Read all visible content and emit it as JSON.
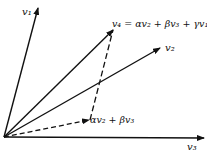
{
  "diagram": {
    "labels": {
      "v1": "v₁",
      "v2": "v₂",
      "v3": "v₃",
      "v4": "v₄ = αv₂ + βv₃ + γv₁",
      "projection": "αv₂ + βv₃"
    },
    "vectors": [
      {
        "name": "v1",
        "from": [
          4,
          137
        ],
        "to": [
          38,
          8
        ],
        "style": "solid"
      },
      {
        "name": "v2",
        "from": [
          4,
          137
        ],
        "to": [
          160,
          48
        ],
        "style": "solid"
      },
      {
        "name": "v3",
        "from": [
          4,
          137
        ],
        "to": [
          204,
          138
        ],
        "style": "solid"
      },
      {
        "name": "v4",
        "from": [
          4,
          137
        ],
        "to": [
          113,
          30
        ],
        "style": "solid"
      },
      {
        "name": "projection",
        "from": [
          4,
          137
        ],
        "to": [
          90,
          120
        ],
        "style": "dashed"
      }
    ],
    "color": "#111111"
  }
}
